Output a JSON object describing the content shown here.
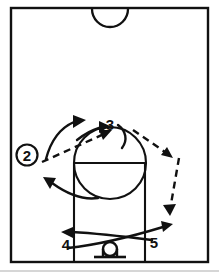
{
  "diagram": {
    "type": "basketball-play-diagram",
    "title": "",
    "court_view": "half-court",
    "background_color": "#ffffff",
    "line_color": "#111111",
    "page_edge_color": "#c9c9c9"
  },
  "court": {
    "border": {
      "x": 11,
      "y": 8,
      "width": 197,
      "height": 254
    },
    "center_circle_arc": {
      "cx": 110,
      "cy": 9,
      "r": 18,
      "label": "center-circle-arc"
    },
    "lane": {
      "left_x": 74,
      "right_x": 145,
      "top_y": 163,
      "bottom_y": 262
    },
    "free_throw_line_y": 163,
    "free_throw_circle": {
      "cx": 110,
      "cy": 163,
      "r": 36
    },
    "hoop": {
      "cx": 110,
      "cy": 250,
      "r": 7,
      "backboard_y": 256,
      "backboard_half_width": 16
    }
  },
  "players": [
    {
      "id": "2",
      "label": "2",
      "circled": true,
      "x": 27,
      "y": 155,
      "role": "wing-ball-handler"
    },
    {
      "id": "3",
      "label": "3",
      "circled": false,
      "x": 110,
      "y": 124,
      "role": "top-of-key"
    },
    {
      "id": "4",
      "label": "4",
      "circled": false,
      "x": 66,
      "y": 244,
      "role": "left-low-post"
    },
    {
      "id": "5",
      "label": "5",
      "circled": false,
      "x": 154,
      "y": 242,
      "role": "right-low-post"
    }
  ],
  "movements": [
    {
      "id": "pass-2-to-3",
      "kind": "pass",
      "style": "dashed",
      "from": "2",
      "to": "3",
      "description": "Player 2 passes the ball to player 3 at the top of the key"
    },
    {
      "id": "cut-2-around-top",
      "kind": "cut",
      "style": "solid",
      "from": "2",
      "to": "top-left-wing",
      "description": "Player 2 cuts up and around toward the left side above the arc"
    },
    {
      "id": "cut-3-curl",
      "kind": "cut",
      "style": "solid",
      "from": "3",
      "to": "left-elbow",
      "description": "Player 3 curls into the free throw circle area"
    },
    {
      "id": "cut-left-wing",
      "kind": "cut",
      "style": "solid",
      "from": "low-post",
      "to": "left-wing",
      "description": "Curling cut out of the lane toward the left wing"
    },
    {
      "id": "pass-3-to-right-wing",
      "kind": "pass",
      "style": "dashed",
      "from": "3",
      "to": "right-wing",
      "description": "Dashed pass from player 3 out to the right wing"
    },
    {
      "id": "pass-right-wing-to-corner",
      "kind": "pass",
      "style": "dashed",
      "from": "right-wing",
      "to": "right-baseline",
      "description": "Dashed pass down the right side toward the baseline"
    },
    {
      "id": "cut-4-to-right",
      "kind": "cut",
      "style": "solid",
      "from": "4",
      "to": "right-baseline",
      "description": "Player 4 cuts across the lane to the right baseline"
    },
    {
      "id": "cut-5-to-left",
      "kind": "cut",
      "style": "solid",
      "from": "5",
      "to": "left-baseline",
      "description": "Player 5 cuts across the lane to the left baseline"
    }
  ],
  "legend": {
    "solid_line_meaning": "player movement / cut",
    "dashed_line_meaning": "pass"
  }
}
